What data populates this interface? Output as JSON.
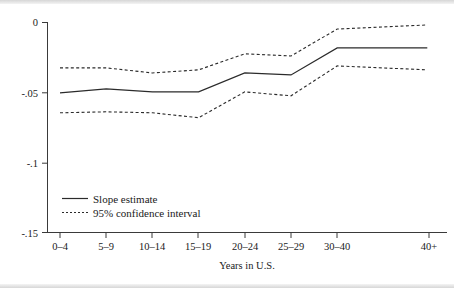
{
  "figure": {
    "background_color": "#ffffff",
    "line_color": "#2b2b2b",
    "axis_color": "#3a3a3a"
  },
  "axis": {
    "xlabel": "Years in U.S.",
    "ylabel": "",
    "ytick_labels": [
      "0",
      "-.05",
      "-.1",
      "-.15"
    ],
    "xtick_labels": [
      "0–4",
      "5–9",
      "10–14",
      "15–19",
      "20–24",
      "25–29",
      "30–40",
      "40+"
    ]
  },
  "legend": {
    "position": "inside-lower-left",
    "entries": [
      {
        "label": "Slope estimate",
        "style": "solid"
      },
      {
        "label": "95% confidence interval",
        "style": "dotted"
      }
    ]
  },
  "chart_data": {
    "type": "line",
    "title": "",
    "xlabel": "Years in U.S.",
    "ylabel": "",
    "grid": false,
    "ylim": [
      -0.15,
      0
    ],
    "ytick_values": [
      0,
      -0.05,
      -0.1,
      -0.15
    ],
    "categories": [
      "0–4",
      "5–9",
      "10–14",
      "15–19",
      "20–24",
      "25–29",
      "30–40",
      "40+"
    ],
    "x_positions": [
      0,
      1,
      2,
      3,
      4,
      5,
      6,
      7.95
    ],
    "legend_position": "lower left inside axes",
    "series": [
      {
        "name": "Slope estimate",
        "style": "solid",
        "values": [
          -0.0505,
          -0.0476,
          -0.0498,
          -0.0498,
          -0.0363,
          -0.0377,
          -0.0185,
          -0.0185
        ]
      },
      {
        "name": "95% confidence interval upper",
        "style": "dotted",
        "values": [
          -0.0327,
          -0.0327,
          -0.0363,
          -0.0341,
          -0.0227,
          -0.0242,
          -0.005,
          -0.0021
        ]
      },
      {
        "name": "95% confidence interval lower",
        "style": "dotted",
        "values": [
          -0.0647,
          -0.064,
          -0.0647,
          -0.0682,
          -0.0498,
          -0.0526,
          -0.0313,
          -0.0341
        ]
      }
    ]
  }
}
